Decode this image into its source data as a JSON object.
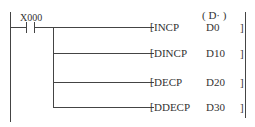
{
  "contact": {
    "label": "X000"
  },
  "operand_header": "( D· )",
  "rungs": [
    {
      "instr": "INCP",
      "operand": "D0"
    },
    {
      "instr": "DINCP",
      "operand": "D10"
    },
    {
      "instr": "DECP",
      "operand": "D20"
    },
    {
      "instr": "DDECP",
      "operand": "D30"
    }
  ]
}
